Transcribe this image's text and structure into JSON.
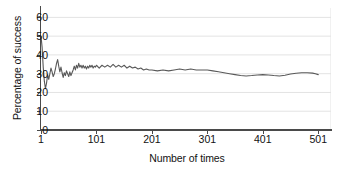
{
  "chart_data": {
    "type": "line",
    "title": "",
    "xlabel": "Number of times",
    "ylabel": "Percentage of success",
    "xlim": [
      1,
      524
    ],
    "ylim": [
      0,
      65
    ],
    "xticks": [
      1,
      101,
      201,
      301,
      401,
      501
    ],
    "xtick_labels": [
      "1",
      "101",
      "201",
      "301",
      "401",
      "501"
    ],
    "yticks": [
      0,
      10,
      20,
      30,
      40,
      50,
      60
    ],
    "ytick_labels": [
      "0",
      "10",
      "20",
      "30",
      "40",
      "50",
      "60"
    ],
    "grid": "horizontal",
    "grid_color": "#e3e3e3",
    "axis_color": "#4a4a4a",
    "line_color": "#595959",
    "line_width": 1.1,
    "background": "#ffffff",
    "legend": null,
    "series": [
      {
        "name": "Percentage of success",
        "x": [
          1,
          3,
          5,
          7,
          9,
          11,
          13,
          15,
          17,
          19,
          21,
          23,
          25,
          27,
          29,
          31,
          33,
          35,
          37,
          39,
          41,
          43,
          45,
          47,
          49,
          51,
          53,
          55,
          57,
          59,
          61,
          63,
          65,
          67,
          69,
          71,
          73,
          75,
          77,
          79,
          81,
          83,
          85,
          87,
          89,
          91,
          93,
          95,
          97,
          99,
          101,
          106,
          111,
          116,
          121,
          126,
          131,
          136,
          141,
          146,
          151,
          156,
          161,
          166,
          171,
          176,
          181,
          186,
          191,
          196,
          201,
          211,
          221,
          231,
          241,
          251,
          261,
          271,
          281,
          291,
          301,
          311,
          321,
          331,
          341,
          351,
          361,
          371,
          381,
          391,
          401,
          411,
          421,
          431,
          441,
          451,
          461,
          471,
          481,
          491,
          496,
          501
        ],
        "y": [
          50.0,
          44.0,
          33.5,
          26.0,
          22.0,
          25.0,
          29.5,
          27.0,
          30.0,
          33.0,
          31.0,
          28.5,
          30.0,
          32.5,
          35.5,
          37.5,
          34.0,
          31.0,
          33.5,
          30.5,
          28.0,
          30.5,
          29.0,
          31.5,
          30.0,
          28.5,
          31.0,
          29.0,
          30.5,
          32.0,
          34.0,
          32.0,
          34.5,
          33.0,
          35.5,
          33.5,
          34.5,
          33.0,
          34.5,
          33.0,
          34.0,
          32.5,
          34.0,
          33.0,
          34.5,
          33.5,
          34.5,
          33.0,
          34.0,
          33.5,
          34.5,
          33.0,
          34.5,
          33.5,
          34.5,
          33.5,
          35.0,
          33.5,
          34.5,
          33.5,
          34.5,
          33.0,
          34.0,
          33.0,
          33.5,
          32.5,
          33.0,
          32.0,
          32.5,
          32.0,
          32.0,
          31.5,
          32.0,
          31.5,
          32.0,
          32.5,
          32.0,
          32.5,
          32.0,
          32.0,
          32.0,
          31.5,
          31.0,
          30.5,
          30.0,
          29.5,
          29.0,
          28.8,
          29.0,
          29.3,
          29.5,
          29.3,
          29.0,
          28.8,
          29.2,
          29.8,
          30.2,
          30.5,
          30.5,
          30.3,
          30.0,
          29.5
        ]
      }
    ]
  }
}
